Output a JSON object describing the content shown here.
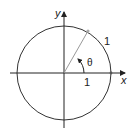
{
  "diagram": {
    "labels": {
      "y_axis": "y",
      "x_axis": "x",
      "radius": "1",
      "x_unit": "1",
      "angle": "θ"
    },
    "colors": {
      "circle": "#333333",
      "axes": "#222222",
      "radius_line": "#999999",
      "point": "#aaaaaa"
    },
    "geometry": {
      "center": [
        64,
        73
      ],
      "radius": 47,
      "angle_degrees": 62
    }
  }
}
